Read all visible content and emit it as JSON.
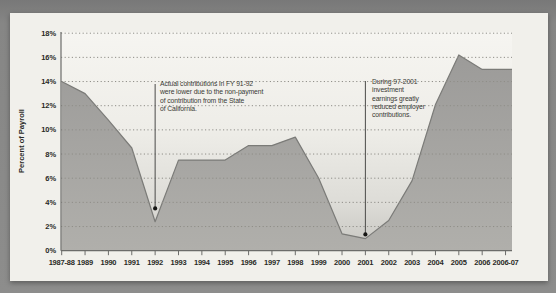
{
  "colors": {
    "surround": "#868685",
    "panel_bg": "#f1f0eb",
    "plot_bg_top": "#f6f5f1",
    "plot_bg_bottom": "#c7c6c1",
    "area_fill_top": "#9c9b99",
    "area_fill_bottom": "#b0afab",
    "line_stroke": "#7b7b78",
    "gridline": "#8f8e88",
    "axis": "#6c6c6a",
    "annotation_line": "#4a4a48",
    "dot": "#161614",
    "text": "#2a2a26"
  },
  "chart_data": {
    "type": "area",
    "title": "",
    "xlabel": "",
    "ylabel": "Percent of Payroll",
    "categories": [
      "1987-88",
      "1989",
      "1990",
      "1991",
      "1992",
      "1993",
      "1994",
      "1995",
      "1996",
      "1997",
      "1998",
      "1999",
      "2000",
      "2001",
      "2002",
      "2003",
      "2004",
      "2005",
      "2006",
      "2006-07"
    ],
    "values": [
      14.0,
      13.0,
      10.8,
      8.5,
      2.4,
      7.5,
      7.5,
      7.5,
      8.7,
      8.7,
      9.4,
      6.0,
      1.4,
      1.0,
      2.5,
      5.8,
      12.1,
      16.2,
      15.0,
      15.0
    ],
    "ylim": [
      0,
      18
    ],
    "yticks": [
      "18%",
      "16%",
      "14%",
      "12%",
      "10%",
      "8%",
      "6%",
      "4%",
      "2%",
      "0%"
    ],
    "grid": "dotted horizontal every 2%",
    "legend": "none",
    "annotations": [
      {
        "text": "Actual contributions in FY 91-92\nwere lower due to the non-payment\nof contribution from the State\nof California.",
        "anchor_category": "1992",
        "dot_value": 3.5
      },
      {
        "text": "During 97-2001\ninvestment\nearnings greatly\nreduced employer\ncontributions.",
        "anchor_category": "2001",
        "dot_value": 1.35
      }
    ]
  }
}
